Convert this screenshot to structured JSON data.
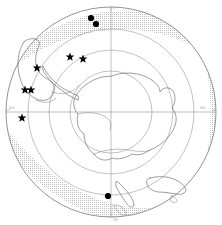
{
  "figure": {
    "projection": "polar-stereographic",
    "center_label": "South Pole",
    "background_color": "#ffffff",
    "line_color": "#5c5c5c",
    "graticule_color": "#8d8d8d",
    "marker_color": "#000000",
    "ice_band_color": "#c9c9c9"
  },
  "chart_data": {
    "type": "scatter",
    "xlabel": "",
    "ylabel": "",
    "projection": "polar-stereographic",
    "center": {
      "x": 111,
      "y": 112,
      "label": "South Pole"
    },
    "grid": true,
    "legend": "none",
    "latitude_circles": [
      {
        "label": "30 S",
        "radius": 105
      },
      {
        "label": "40 S",
        "radius": 83
      },
      {
        "label": "50 S",
        "radius": 62
      },
      {
        "label": "60 S",
        "radius": 41
      }
    ],
    "meridians": [
      {
        "label": "0",
        "angle_deg": 90
      },
      {
        "label": "90 W",
        "angle_deg": 180
      },
      {
        "label": "90 E",
        "angle_deg": 0
      },
      {
        "label": "180",
        "angle_deg": 270
      }
    ],
    "axis_tick_labels": [
      {
        "text": "60 S",
        "x": 14,
        "y": 113
      },
      {
        "text": "60 E",
        "x": 206,
        "y": 113
      },
      {
        "text": "0",
        "x": 112,
        "y": 6
      },
      {
        "text": "180",
        "x": 112,
        "y": 220
      }
    ],
    "series": [
      {
        "name": "star-sites",
        "marker": "star",
        "count": 5,
        "points": [
          {
            "x": 37,
            "y": 68
          },
          {
            "x": 70,
            "y": 57
          },
          {
            "x": 83,
            "y": 59
          },
          {
            "x": 25,
            "y": 90
          },
          {
            "x": 31,
            "y": 90
          },
          {
            "x": 22,
            "y": 118
          }
        ]
      },
      {
        "name": "circle-sites",
        "marker": "filled-circle",
        "count": 3,
        "points": [
          {
            "x": 91,
            "y": 18
          },
          {
            "x": 96,
            "y": 24
          },
          {
            "x": 108,
            "y": 196
          }
        ]
      }
    ],
    "annotations": [
      {
        "name": "ice-band",
        "type": "stippled-region",
        "description": "Stippled sea-ice / frontal band forming a broad arc around the outer ocean"
      },
      {
        "name": "antarctica",
        "type": "landmass",
        "description": "Antarctic continent at map center"
      },
      {
        "name": "antarctic-peninsula",
        "type": "landmass",
        "description": "Peninsula extending toward upper left"
      },
      {
        "name": "south-america",
        "type": "landmass",
        "description": "Southern tip of South America at upper left"
      },
      {
        "name": "new-zealand",
        "type": "landmass",
        "description": "New Zealand at lower center"
      },
      {
        "name": "australia-tasmania",
        "type": "landmass",
        "description": "Australia and Tasmania at lower right"
      }
    ]
  }
}
